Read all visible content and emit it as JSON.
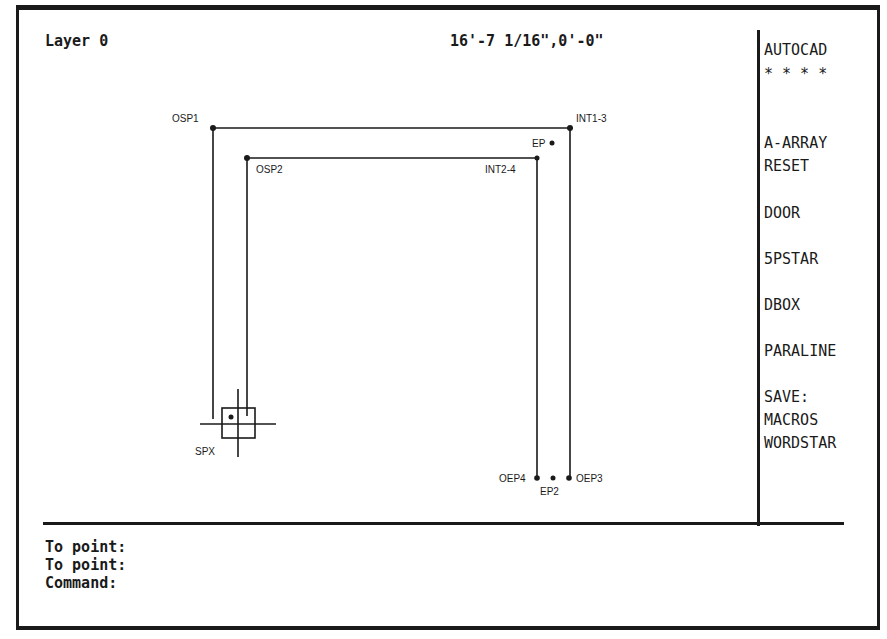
{
  "status_bar": {
    "layer": "Layer 0",
    "coordinates": "16'-7 1/16\",0'-0\""
  },
  "screen_menu": {
    "items": [
      {
        "label": "AUTOCAD",
        "top": 42
      },
      {
        "label": "* * * *",
        "top": 66
      },
      {
        "label": "A-ARRAY",
        "top": 135
      },
      {
        "label": "RESET",
        "top": 158
      },
      {
        "label": "DOOR",
        "top": 205
      },
      {
        "label": "5PSTAR",
        "top": 251
      },
      {
        "label": "DBOX",
        "top": 297
      },
      {
        "label": "PARALINE",
        "top": 343
      },
      {
        "label": "SAVE:",
        "top": 389
      },
      {
        "label": "MACROS",
        "top": 412
      },
      {
        "label": "WORDSTAR",
        "top": 435
      }
    ]
  },
  "command_area": {
    "lines": [
      "To point:",
      "To point:",
      "Command:"
    ]
  },
  "drawing": {
    "points": {
      "OSP1": "OSP1",
      "OSP2": "OSP2",
      "INT1_3": "INT1-3",
      "INT2_4": "INT2-4",
      "EP": "EP",
      "EP2": "EP2",
      "OEP3": "OEP3",
      "OEP4": "OEP4",
      "SPX": "SPX"
    },
    "line_color": "#1a1a1a"
  }
}
